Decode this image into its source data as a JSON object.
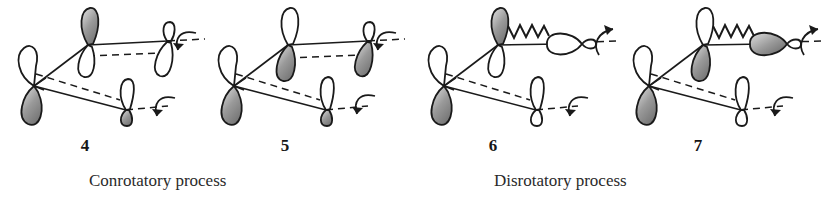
{
  "figure": {
    "background_color": "#ffffff",
    "ink_color": "#1a1a1a",
    "lobe_fill_shaded": "#8c8c8c",
    "lobe_fill_empty": "#ffffff"
  },
  "structures": [
    {
      "id": "structure-4",
      "number_label": "4",
      "process": "conrotatory",
      "bond_style": "solid",
      "terminal_orbital_orientation": "vertical",
      "rotation_top": "clockwise-down",
      "rotation_bottom": "clockwise-down",
      "orbitals": [
        {
          "name": "left-terminal-orbital",
          "top_lobe": "empty",
          "bottom_lobe": "shaded"
        },
        {
          "name": "upper-middle-orbital",
          "top_lobe": "shaded",
          "bottom_lobe": "empty"
        },
        {
          "name": "upper-right-orbital",
          "top_lobe": "empty",
          "bottom_lobe": "empty"
        },
        {
          "name": "lower-middle-orbital",
          "top_lobe": "empty",
          "bottom_lobe": "shaded"
        }
      ]
    },
    {
      "id": "structure-5",
      "number_label": "5",
      "process": "conrotatory",
      "bond_style": "solid",
      "terminal_orbital_orientation": "vertical",
      "rotation_top": "clockwise-down",
      "rotation_bottom": "clockwise-down",
      "orbitals": [
        {
          "name": "left-terminal-orbital",
          "top_lobe": "empty",
          "bottom_lobe": "shaded"
        },
        {
          "name": "upper-middle-orbital",
          "top_lobe": "empty",
          "bottom_lobe": "shaded"
        },
        {
          "name": "upper-right-orbital",
          "top_lobe": "empty",
          "bottom_lobe": "shaded"
        },
        {
          "name": "lower-middle-orbital",
          "top_lobe": "empty",
          "bottom_lobe": "shaded"
        }
      ]
    },
    {
      "id": "structure-6",
      "number_label": "6",
      "process": "disrotatory",
      "bond_style": "wavy",
      "terminal_orbital_orientation": "horizontal",
      "rotation_top": "counterclockwise-up",
      "rotation_bottom": "clockwise-down",
      "orbitals": [
        {
          "name": "left-terminal-orbital",
          "top_lobe": "empty",
          "bottom_lobe": "shaded"
        },
        {
          "name": "upper-middle-orbital",
          "top_lobe": "shaded",
          "bottom_lobe": "empty"
        },
        {
          "name": "upper-right-orbital",
          "left_lobe": "empty",
          "right_lobe": "empty"
        },
        {
          "name": "lower-middle-orbital",
          "top_lobe": "empty",
          "bottom_lobe": "empty"
        }
      ]
    },
    {
      "id": "structure-7",
      "number_label": "7",
      "process": "disrotatory",
      "bond_style": "wavy",
      "terminal_orbital_orientation": "horizontal",
      "rotation_top": "counterclockwise-up",
      "rotation_bottom": "clockwise-down",
      "orbitals": [
        {
          "name": "left-terminal-orbital",
          "top_lobe": "empty",
          "bottom_lobe": "shaded"
        },
        {
          "name": "upper-middle-orbital",
          "top_lobe": "empty",
          "bottom_lobe": "shaded"
        },
        {
          "name": "upper-right-orbital",
          "left_lobe": "shaded",
          "right_lobe": "empty"
        },
        {
          "name": "lower-middle-orbital",
          "top_lobe": "empty",
          "bottom_lobe": "empty"
        }
      ]
    }
  ],
  "captions": {
    "left": "Conrotatory process",
    "right": "Disrotatory process"
  }
}
